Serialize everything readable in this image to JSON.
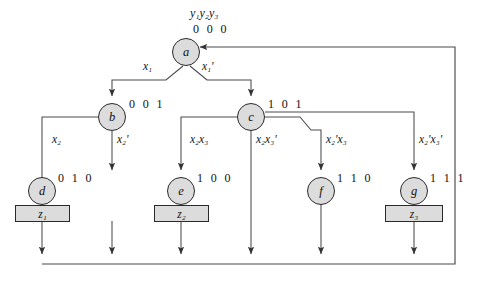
{
  "diagram": {
    "type": "state-transition-flow-diagram",
    "state_variable_header": "y₁y₂y₃",
    "nodes": [
      {
        "id": "a",
        "label": "a",
        "code": "0 0 0",
        "output": null
      },
      {
        "id": "b",
        "label": "b",
        "code": "0 0 1",
        "output": null
      },
      {
        "id": "c",
        "label": "c",
        "code": "1 0 1",
        "output": null
      },
      {
        "id": "d",
        "label": "d",
        "code": "0 1 0",
        "output": "z₁"
      },
      {
        "id": "e",
        "label": "e",
        "code": "1 0 0",
        "output": "z₂"
      },
      {
        "id": "f",
        "label": "f",
        "code": "1 1 0",
        "output": null
      },
      {
        "id": "g",
        "label": "g",
        "code": "1 1 1",
        "output": "z₃"
      }
    ],
    "edges": [
      {
        "from": "a",
        "to": "b",
        "condition": "x₁"
      },
      {
        "from": "a",
        "to": "c",
        "condition": "x₁'"
      },
      {
        "from": "b",
        "to": "feedback",
        "condition": "x₂"
      },
      {
        "from": "b",
        "to": "d",
        "condition": "x₂'"
      },
      {
        "from": "c",
        "to": "e",
        "condition": "x₂x₃"
      },
      {
        "from": "c",
        "to": "feedback",
        "condition": "x₂x₃'"
      },
      {
        "from": "c",
        "to": "f",
        "condition": "x₂'x₃"
      },
      {
        "from": "c",
        "to": "g",
        "condition": "x₂'x₃'"
      }
    ],
    "outputs": [
      "z₁",
      "z₂",
      "z₃"
    ],
    "feedback_target": "a",
    "colors": {
      "node_fill": "#dcdcdc",
      "node_stroke": "#2a2a2a",
      "box_fill": "#dcdcdc",
      "box_stroke": "#2a2a2a",
      "wire": "#4a4a4a",
      "background": "#ffffff"
    }
  }
}
